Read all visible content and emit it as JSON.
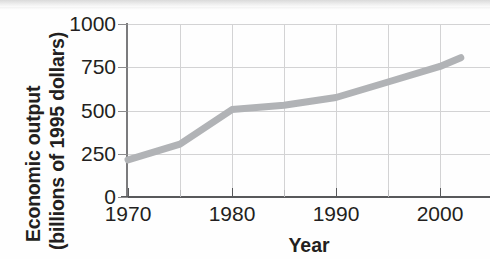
{
  "figure": {
    "y_axis_title_line1": "Economic output",
    "y_axis_title_line2": "(billions of 1995 dollars)",
    "x_axis_title": "Year",
    "line_color": "#b1b3b6",
    "grid_color": "#d3d3d4",
    "axis_color": "#58595b",
    "text_color": "#231f20"
  },
  "chart_data": {
    "type": "line",
    "title": "",
    "subtitle": "",
    "xlabel": "Year",
    "ylabel": "Economic output (billions of 1995 dollars)",
    "xlim": [
      1970,
      2002
    ],
    "ylim": [
      0,
      1000
    ],
    "yticks": [
      0,
      250,
      500,
      750,
      1000
    ],
    "ytick_labels": [
      "0",
      "250",
      "500",
      "750",
      "1000"
    ],
    "xticks": [
      1970,
      1980,
      1990,
      2000
    ],
    "xtick_labels": [
      "1970",
      "1980",
      "1990",
      "2000"
    ],
    "x_minor_ticks": [
      1975,
      1985,
      1995
    ],
    "grid": true,
    "legend": false,
    "series": [
      {
        "name": "Economic output",
        "color": "#b1b3b6",
        "x": [
          1970,
          1975,
          1980,
          1985,
          1990,
          1995,
          2000,
          2002
        ],
        "values": [
          215,
          305,
          505,
          530,
          575,
          665,
          755,
          805
        ]
      }
    ]
  }
}
